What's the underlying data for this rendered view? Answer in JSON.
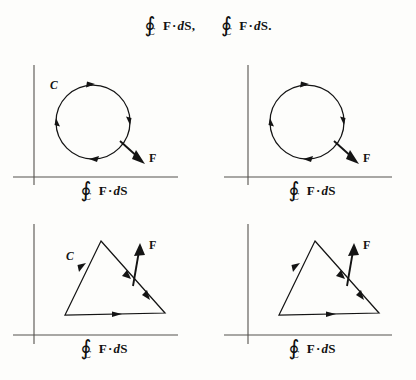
{
  "figure": {
    "type": "math-diagram-grid",
    "background_color": "#fdfdfb",
    "ink_color": "#141414",
    "axis_color": "#55524e"
  },
  "header": {
    "expressions": [
      {
        "integral_symbol": "∮",
        "subscript": "C",
        "body_vector": "F",
        "dot": "·",
        "differential_italic": "d",
        "differential_vector": "S",
        "tail": ","
      },
      {
        "integral_symbol": "∮",
        "subscript": "C",
        "body_vector": "F",
        "dot": "·",
        "differential_italic": "d",
        "differential_vector": "S",
        "tail": "."
      }
    ]
  },
  "panels": [
    {
      "id": "top-left",
      "shape": "circle",
      "orientation": "clockwise",
      "curve_label": "C",
      "has_curve_label": true,
      "vector_label": "F",
      "vector_direction": "down-right",
      "caption": {
        "integral_symbol": "∮",
        "subscript": "C",
        "body_vector": "F",
        "dot": "·",
        "differential_italic": "d",
        "differential_vector": "S",
        "tail": ""
      }
    },
    {
      "id": "top-right",
      "shape": "circle",
      "orientation": "clockwise",
      "curve_label": "",
      "has_curve_label": false,
      "vector_label": "F",
      "vector_direction": "down-right",
      "caption": {
        "integral_symbol": "∮",
        "subscript": "C",
        "body_vector": "F",
        "dot": "·",
        "differential_italic": "d",
        "differential_vector": "S",
        "tail": ""
      }
    },
    {
      "id": "bottom-left",
      "shape": "triangle",
      "orientation": "clockwise",
      "curve_label": "C",
      "has_curve_label": true,
      "vector_label": "F",
      "vector_direction": "up",
      "caption": {
        "integral_symbol": "∮",
        "subscript": "C",
        "body_vector": "F",
        "dot": "·",
        "differential_italic": "d",
        "differential_vector": "S",
        "tail": ""
      }
    },
    {
      "id": "bottom-right",
      "shape": "triangle",
      "orientation": "clockwise",
      "curve_label": "",
      "has_curve_label": false,
      "vector_label": "F",
      "vector_direction": "up",
      "caption": {
        "integral_symbol": "∮",
        "subscript": "C",
        "body_vector": "F",
        "dot": "·",
        "differential_italic": "d",
        "differential_vector": "S",
        "tail": ""
      }
    }
  ]
}
